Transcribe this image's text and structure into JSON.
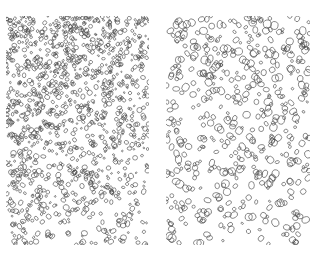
{
  "figure": {
    "width": 317,
    "height": 261,
    "background": "#ffffff",
    "stroke_color": "#4a4a4a",
    "panels": [
      {
        "id": "left",
        "label": "dense stippled oval cells (density decreasing toward bottom-right)",
        "x": 6,
        "y": 16,
        "width": 143,
        "height": 229,
        "count": 1250,
        "size_min": 0.9,
        "size_max": 3.2,
        "density_gradient": "top-left-dense",
        "seed": 17
      },
      {
        "id": "right",
        "label": "sparser stippled oval cells with larger outlines",
        "x": 166,
        "y": 16,
        "width": 144,
        "height": 229,
        "count": 520,
        "size_min": 1.2,
        "size_max": 4.2,
        "density_gradient": "top-dense",
        "seed": 91
      }
    ]
  }
}
